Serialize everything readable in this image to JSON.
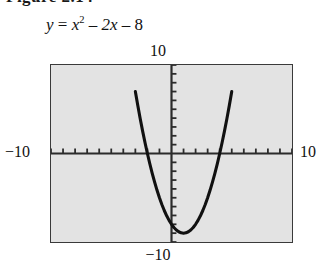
{
  "figure": {
    "heading": "Figure 2.14",
    "equation": {
      "lhs": "y",
      "equals": "=",
      "term1_base": "x",
      "term1_exp": "2",
      "minus1": "–",
      "term2": "2x",
      "minus2": "–",
      "term3": "8",
      "plain": "y = x2 – 2x – 8"
    }
  },
  "labels": {
    "y_max": "10",
    "y_min": "−10",
    "x_min": "−10",
    "x_max": "10"
  },
  "colors": {
    "plot_background": "#e3e3e3",
    "frame_border": "#3a3a3a",
    "axis": "#2b2b2b",
    "curve": "#111111",
    "page_background": "#ffffff"
  },
  "chart_data": {
    "type": "line",
    "xlabel": "x",
    "ylabel": "y",
    "xlim": [
      -10,
      10
    ],
    "ylim": [
      -10,
      10
    ],
    "grid": false,
    "legend": null,
    "axis_ticks": {
      "x_tick_interval": 1,
      "y_tick_interval": 1,
      "x_ticks": [
        -10,
        -9,
        -8,
        -7,
        -6,
        -5,
        -4,
        -3,
        -2,
        -1,
        0,
        1,
        2,
        3,
        4,
        5,
        6,
        7,
        8,
        9,
        10
      ],
      "y_ticks": [
        -10,
        -9,
        -8,
        -7,
        -6,
        -5,
        -4,
        -3,
        -2,
        -1,
        0,
        1,
        2,
        3,
        4,
        5,
        6,
        7,
        8,
        9,
        10
      ],
      "tick_labels_shown": [
        "10",
        "−10",
        "−10",
        "10"
      ]
    },
    "function": "y = x^2 - 2x - 8",
    "vertex": [
      1,
      -9
    ],
    "roots": [
      -2,
      4
    ],
    "y_intercept": -8,
    "series": [
      {
        "name": "y = x² – 2x – 8",
        "x": [
          -3.0,
          -2.8,
          -2.6,
          -2.4,
          -2.2,
          -2.0,
          -1.8,
          -1.6,
          -1.4,
          -1.2,
          -1.0,
          -0.8,
          -0.6,
          -0.4,
          -0.2,
          0.0,
          0.2,
          0.4,
          0.6,
          0.8,
          1.0,
          1.2,
          1.4,
          1.6,
          1.8,
          2.0,
          2.2,
          2.4,
          2.6,
          2.8,
          3.0,
          3.2,
          3.4,
          3.6,
          3.8,
          4.0,
          4.2,
          4.4,
          4.6,
          4.8,
          5.0
        ],
        "y": [
          7.0,
          5.44,
          3.96,
          2.56,
          1.24,
          0.0,
          -1.16,
          -2.24,
          -3.24,
          -4.16,
          -5.0,
          -5.76,
          -6.44,
          -7.04,
          -7.56,
          -8.0,
          -8.36,
          -8.64,
          -8.84,
          -8.96,
          -9.0,
          -8.96,
          -8.84,
          -8.64,
          -8.36,
          -8.0,
          -7.56,
          -7.04,
          -6.44,
          -5.76,
          -5.0,
          -4.16,
          -3.24,
          -2.24,
          -1.16,
          0.0,
          1.24,
          2.56,
          3.96,
          5.44,
          7.0
        ]
      }
    ]
  }
}
